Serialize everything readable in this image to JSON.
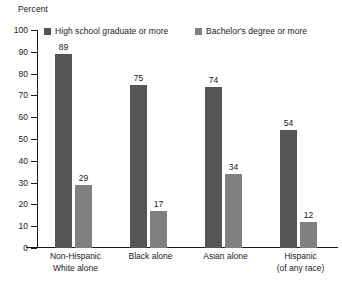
{
  "chart_data": {
    "type": "bar",
    "title": "",
    "ylabel": "Percent",
    "xlabel": "",
    "ylim": [
      0,
      100
    ],
    "ytick_step": 10,
    "yticks": [
      100,
      90,
      80,
      70,
      60,
      50,
      40,
      30,
      20,
      10,
      0
    ],
    "grid": false,
    "legend_position": "top",
    "categories": [
      "Non-Hispanic White alone",
      "Black alone",
      "Asian alone",
      "Hispanic (of any race)"
    ],
    "category_lines": [
      [
        "Non-Hispanic",
        "White alone"
      ],
      [
        "Black alone",
        ""
      ],
      [
        "Asian alone",
        ""
      ],
      [
        "Hispanic",
        "(of any race)"
      ]
    ],
    "series": [
      {
        "name": "High school graduate or more",
        "color": "#555555",
        "values": [
          89,
          75,
          74,
          54
        ]
      },
      {
        "name": "Bachelor's degree or more",
        "color": "#808080",
        "values": [
          29,
          17,
          34,
          12
        ]
      }
    ]
  },
  "legend": {
    "items": [
      {
        "label": "High school graduate or more",
        "color": "#555555"
      },
      {
        "label": "Bachelor's degree or more",
        "color": "#808080"
      }
    ]
  },
  "axis": {
    "y_title": "Percent"
  },
  "colors": {
    "series_1": "#555555",
    "series_2": "#808080",
    "axis": "#1a1a1a",
    "background": "#ffffff"
  }
}
